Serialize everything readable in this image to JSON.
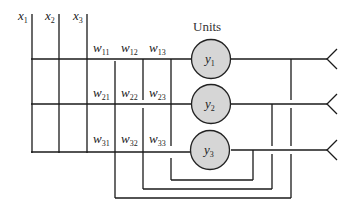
{
  "diagram": {
    "title": "Units",
    "inputs": [
      {
        "id": "x1",
        "label": "x",
        "sub": "1"
      },
      {
        "id": "x2",
        "label": "x",
        "sub": "2"
      },
      {
        "id": "x3",
        "label": "x",
        "sub": "3"
      }
    ],
    "units": [
      {
        "id": "y1",
        "label": "y",
        "sub": "1"
      },
      {
        "id": "y2",
        "label": "y",
        "sub": "2"
      },
      {
        "id": "y3",
        "label": "y",
        "sub": "3"
      }
    ],
    "weights": [
      [
        {
          "label": "w",
          "sub": "11"
        },
        {
          "label": "w",
          "sub": "12"
        },
        {
          "label": "w",
          "sub": "13"
        }
      ],
      [
        {
          "label": "w",
          "sub": "21"
        },
        {
          "label": "w",
          "sub": "22"
        },
        {
          "label": "w",
          "sub": "23"
        }
      ],
      [
        {
          "label": "w",
          "sub": "31"
        },
        {
          "label": "w",
          "sub": "32"
        },
        {
          "label": "w",
          "sub": "33"
        }
      ]
    ],
    "colors": {
      "node_fill": "#d6d6d6",
      "line": "#1a1a1a"
    }
  }
}
